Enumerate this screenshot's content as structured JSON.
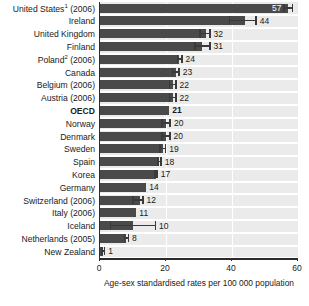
{
  "chart_data": {
    "type": "bar",
    "orientation": "horizontal",
    "title": "",
    "subtitle": "",
    "xlabel": "Age-sex standardised rates per 100 000 population",
    "ylabel": "",
    "xlim": [
      0,
      60
    ],
    "xticks": [
      0,
      20,
      40,
      60
    ],
    "xtick_labels": [
      "0",
      "20",
      "40",
      "60"
    ],
    "grid": true,
    "grid_axis": "x",
    "legend": null,
    "value_labels": true,
    "error_bars": true,
    "categories": [
      "United States¹ (2006)",
      "Ireland",
      "United Kingdom",
      "Finland",
      "Poland² (2006)",
      "Canada",
      "Belgium (2006)",
      "Austria (2006)",
      "OECD",
      "Norway",
      "Denmark",
      "Sweden",
      "Spain",
      "Korea",
      "Germany",
      "Switzerland (2006)",
      "Italy (2006)",
      "Iceland",
      "Netherlands (2005)",
      "New Zealand"
    ],
    "values": [
      57,
      44,
      32,
      31,
      24,
      23,
      22,
      22,
      21,
      20,
      20,
      19,
      18,
      17,
      14,
      12,
      11,
      10,
      8,
      1
    ],
    "rows": [
      {
        "label": "United States¹ (2006)",
        "label_text": "United States",
        "superscript": "1",
        "year": "(2006)",
        "value": 57,
        "value_text": "57",
        "ci_low": 55.5,
        "ci_high": 58.5,
        "bold": false,
        "label_inside": true
      },
      {
        "label": "Ireland",
        "label_text": "Ireland",
        "superscript": "",
        "year": "",
        "value": 44,
        "value_text": "44",
        "ci_low": 39.0,
        "ci_high": 47.5,
        "bold": false,
        "label_inside": false
      },
      {
        "label": "United Kingdom",
        "label_text": "United Kingdom",
        "superscript": "",
        "year": "",
        "value": 32,
        "value_text": "32",
        "ci_low": 30.0,
        "ci_high": 33.5,
        "bold": false,
        "label_inside": false
      },
      {
        "label": "Finland",
        "label_text": "Finland",
        "superscript": "",
        "year": "",
        "value": 31,
        "value_text": "31",
        "ci_low": 28.5,
        "ci_high": 33.5,
        "bold": false,
        "label_inside": false
      },
      {
        "label": "Poland² (2006)",
        "label_text": "Poland",
        "superscript": "2",
        "year": "(2006)",
        "value": 24,
        "value_text": "24",
        "ci_low": 23.2,
        "ci_high": 25.0,
        "bold": false,
        "label_inside": false
      },
      {
        "label": "Canada",
        "label_text": "Canada",
        "superscript": "",
        "year": "",
        "value": 23,
        "value_text": "23",
        "ci_low": 21.8,
        "ci_high": 24.2,
        "bold": false,
        "label_inside": false
      },
      {
        "label": "Belgium (2006)",
        "label_text": "Belgium",
        "superscript": "",
        "year": "(2006)",
        "value": 22,
        "value_text": "22",
        "ci_low": 20.8,
        "ci_high": 23.2,
        "bold": false,
        "label_inside": false
      },
      {
        "label": "Austria (2006)",
        "label_text": "Austria",
        "superscript": "",
        "year": "(2006)",
        "value": 22,
        "value_text": "22",
        "ci_low": 20.8,
        "ci_high": 23.2,
        "bold": false,
        "label_inside": false
      },
      {
        "label": "OECD",
        "label_text": "OECD",
        "superscript": "",
        "year": "",
        "value": 21,
        "value_text": "21",
        "ci_low": null,
        "ci_high": null,
        "bold": true,
        "label_inside": false
      },
      {
        "label": "Norway",
        "label_text": "Norway",
        "superscript": "",
        "year": "",
        "value": 20,
        "value_text": "20",
        "ci_low": 18.5,
        "ci_high": 21.5,
        "bold": false,
        "label_inside": false
      },
      {
        "label": "Denmark",
        "label_text": "Denmark",
        "superscript": "",
        "year": "",
        "value": 20,
        "value_text": "20",
        "ci_low": 18.6,
        "ci_high": 21.4,
        "bold": false,
        "label_inside": false
      },
      {
        "label": "Sweden",
        "label_text": "Sweden",
        "superscript": "",
        "year": "",
        "value": 19,
        "value_text": "19",
        "ci_low": 17.9,
        "ci_high": 20.1,
        "bold": false,
        "label_inside": false
      },
      {
        "label": "Spain",
        "label_text": "Spain",
        "superscript": "",
        "year": "",
        "value": 18,
        "value_text": "18",
        "ci_low": 17.3,
        "ci_high": 18.7,
        "bold": false,
        "label_inside": false
      },
      {
        "label": "Korea",
        "label_text": "Korea",
        "superscript": "",
        "year": "",
        "value": 17,
        "value_text": "17",
        "ci_low": 16.5,
        "ci_high": 17.5,
        "bold": false,
        "label_inside": false
      },
      {
        "label": "Germany",
        "label_text": "Germany",
        "superscript": "",
        "year": "",
        "value": 14,
        "value_text": "14",
        "ci_low": null,
        "ci_high": null,
        "bold": false,
        "label_inside": false
      },
      {
        "label": "Switzerland (2006)",
        "label_text": "Switzerland",
        "superscript": "",
        "year": "(2006)",
        "value": 12,
        "value_text": "12",
        "ci_low": 9.8,
        "ci_high": 13.2,
        "bold": false,
        "label_inside": false
      },
      {
        "label": "Italy (2006)",
        "label_text": "Italy",
        "superscript": "",
        "year": "(2006)",
        "value": 11,
        "value_text": "11",
        "ci_low": null,
        "ci_high": null,
        "bold": false,
        "label_inside": false
      },
      {
        "label": "Iceland",
        "label_text": "Iceland",
        "superscript": "",
        "year": "",
        "value": 10,
        "value_text": "10",
        "ci_low": 3.0,
        "ci_high": 17.0,
        "bold": false,
        "label_inside": false
      },
      {
        "label": "Netherlands (2005)",
        "label_text": "Netherlands",
        "superscript": "",
        "year": "(2005)",
        "value": 8,
        "value_text": "8",
        "ci_low": 7.2,
        "ci_high": 8.8,
        "bold": false,
        "label_inside": false
      },
      {
        "label": "New Zealand",
        "label_text": "New Zealand",
        "superscript": "",
        "year": "",
        "value": 1,
        "value_text": "1",
        "ci_low": 0.4,
        "ci_high": 1.6,
        "bold": false,
        "label_inside": false
      }
    ],
    "colors": {
      "bar": "#4a4a4a",
      "plot_background": "#ebebeb",
      "gridline": "#ffffff",
      "axis": "#2b2b2b",
      "text": "#1a1a1a",
      "value_label_inside": "#ffffff"
    }
  }
}
